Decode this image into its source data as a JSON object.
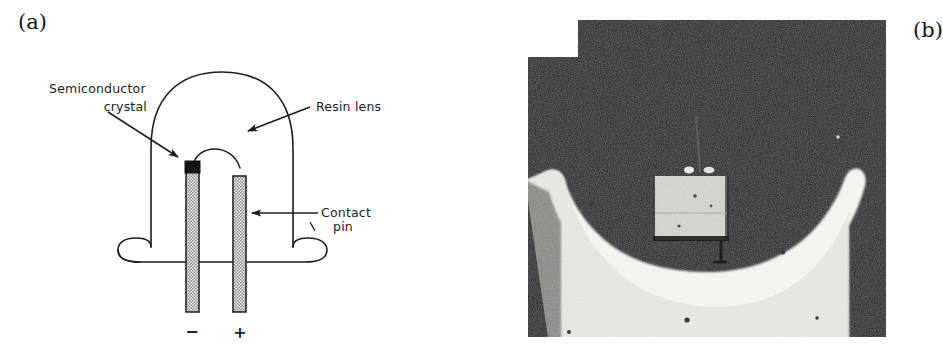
{
  "figure": {
    "caption_style": "two-panel scientific figure",
    "panels": [
      {
        "key": "a",
        "label": "(a)",
        "type": "line-diagram",
        "subject": "LED package cross-section schematic"
      },
      {
        "key": "b",
        "label": "(b)",
        "type": "photograph",
        "subject": "macro photograph of LED reflector cup with semiconductor chip"
      }
    ]
  },
  "panel_a": {
    "label": "(a)",
    "annotations": {
      "semiconductor_crystal": {
        "line1": "Semiconductor",
        "line2": "crystal"
      },
      "resin_lens": "Resin lens",
      "contact_pin": {
        "line1": "Contact",
        "line2": "pin"
      }
    },
    "polarity": {
      "negative": "−",
      "positive": "+"
    },
    "colors": {
      "ink": "#1c1c1c",
      "pin_fill": "#9a9a9a",
      "crystal_fill": "#111111",
      "background": "#ffffff"
    },
    "parts": [
      "resin lens dome",
      "base flange",
      "cathode contact pin",
      "anode contact pin",
      "semiconductor crystal",
      "bond wire"
    ]
  },
  "panel_b": {
    "label": "(b)",
    "colors": {
      "background_dark": "#1b1b1b",
      "reflector_white": "#f2f2ee",
      "chip_gray": "#d8d8d2",
      "wire_dark": "#2a2a2a"
    },
    "features": [
      "dark grainy background",
      "bright white reflector cup with two upswept arms",
      "light gray semiconductor chip square at centre",
      "thin bond wire rising from chip"
    ]
  }
}
